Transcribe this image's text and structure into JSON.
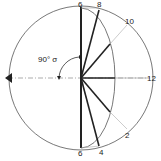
{
  "diagram": {
    "title": "",
    "labels": {
      "top": "6",
      "bottom": "6",
      "p8": "8",
      "p10": "10",
      "p12": "12",
      "p2": "2",
      "p4": "4",
      "angle": "90° σ"
    },
    "colors": {
      "stroke": "#222222",
      "light": "#b5b5b5",
      "background": "#ffffff"
    }
  }
}
